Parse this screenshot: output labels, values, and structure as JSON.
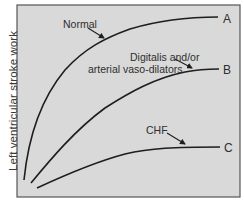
{
  "figure": {
    "y_axis_label": "Left ventricular stroke work",
    "x_axis_label": "",
    "background_color": "#d9d9d9",
    "frame_color": "#555555",
    "curve_color": "#1e1e1e",
    "curves": [
      {
        "id": "A",
        "end_label": "A",
        "annotation": "Normal"
      },
      {
        "id": "B",
        "end_label": "B",
        "annotation_line1": "Digitalis and/or",
        "annotation_line2": "arterial vaso-dilators"
      },
      {
        "id": "C",
        "end_label": "C",
        "annotation": "CHF"
      }
    ]
  }
}
